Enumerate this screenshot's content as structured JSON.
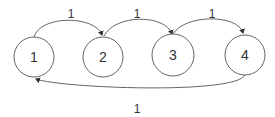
{
  "diagram": {
    "type": "state-transition-graph",
    "nodes": [
      {
        "id": "n1",
        "label": "1"
      },
      {
        "id": "n2",
        "label": "2"
      },
      {
        "id": "n3",
        "label": "3"
      },
      {
        "id": "n4",
        "label": "4"
      }
    ],
    "edges": [
      {
        "from": "n1",
        "to": "n2",
        "label": "1"
      },
      {
        "from": "n2",
        "to": "n3",
        "label": "1"
      },
      {
        "from": "n3",
        "to": "n4",
        "label": "1"
      },
      {
        "from": "n4",
        "to": "n1",
        "label": "1"
      }
    ],
    "colors": {
      "stroke": "#555555",
      "text": "#333333"
    }
  }
}
